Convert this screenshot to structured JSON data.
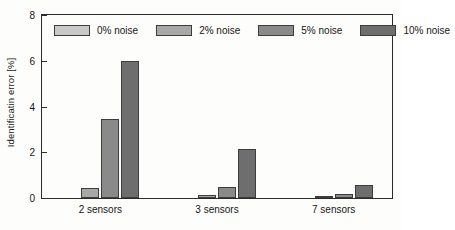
{
  "chart_data": {
    "type": "bar",
    "title": "",
    "subtitle": "",
    "xlabel": "",
    "ylabel": "Identificatin error [%]",
    "categories": [
      "2 sensors",
      "3 sensors",
      "7 sensors"
    ],
    "series": [
      {
        "name": "0% noise",
        "values": [
          0.0,
          0.0,
          0.0
        ],
        "color": "#c9c9c9"
      },
      {
        "name": "2% noise",
        "values": [
          0.45,
          0.15,
          0.08
        ],
        "color": "#a8a8a8"
      },
      {
        "name": "5% noise",
        "values": [
          3.45,
          0.5,
          0.17
        ],
        "color": "#8a8a8a"
      },
      {
        "name": "10% noise",
        "values": [
          6.0,
          2.15,
          0.55
        ],
        "color": "#6e6e6e"
      }
    ],
    "ylim": [
      0,
      8
    ],
    "yticks": [
      0,
      2,
      4,
      6,
      8
    ],
    "ytick_labels": [
      "0",
      "2",
      "4",
      "6",
      "8"
    ],
    "grid": false,
    "legend_position": "top-inside-left",
    "axis_color": "#2b2b2b",
    "background_color": "#fdfdfb"
  },
  "legend": {
    "entries": [
      {
        "label": "0% noise"
      },
      {
        "label": "2% noise"
      },
      {
        "label": "5% noise"
      },
      {
        "label": "10% noise"
      }
    ]
  }
}
